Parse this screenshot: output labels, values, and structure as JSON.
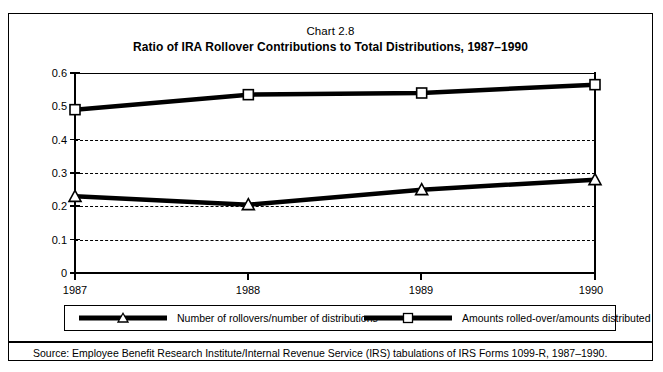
{
  "chart_number": "Chart 2.8",
  "chart_title": "Ratio of IRA Rollover Contributions to Total Distributions, 1987–1990",
  "source_note": "Source: Employee Benefit Research Institute/Internal Revenue Service (IRS) tabulations of IRS Forms 1099-R, 1987–1990.",
  "legend": {
    "entries": [
      {
        "label": "Number of rollovers/number of distributions",
        "marker": "triangle-marker",
        "color": "#000000"
      },
      {
        "label": "Amounts rolled-over/amounts distributed",
        "marker": "square-marker",
        "color": "#000000"
      }
    ]
  },
  "axis": {
    "y_ticks": [
      "0",
      "0.1",
      "0.2",
      "0.3",
      "0.4",
      "0.5",
      "0.6"
    ],
    "x_ticks": [
      "1987",
      "1988",
      "1989",
      "1990"
    ]
  },
  "chart_data": {
    "type": "line",
    "title": "Ratio of IRA Rollover Contributions to Total Distributions, 1987–1990",
    "subtitle": "Chart 2.8",
    "xlabel": "",
    "ylabel": "",
    "x": [
      1987,
      1988,
      1989,
      1990
    ],
    "categories": [
      "1987",
      "1988",
      "1989",
      "1990"
    ],
    "series": [
      {
        "name": "Number of rollovers/number of distributions",
        "marker": "triangle",
        "values": [
          0.23,
          0.205,
          0.25,
          0.28
        ]
      },
      {
        "name": "Amounts rolled-over/amounts distributed",
        "marker": "square",
        "values": [
          0.49,
          0.535,
          0.54,
          0.565
        ]
      }
    ],
    "ylim": [
      0,
      0.6
    ],
    "yticks": [
      0,
      0.1,
      0.2,
      0.3,
      0.4,
      0.5,
      0.6
    ],
    "grid": true,
    "grid_axis": "y",
    "legend_position": "bottom"
  }
}
